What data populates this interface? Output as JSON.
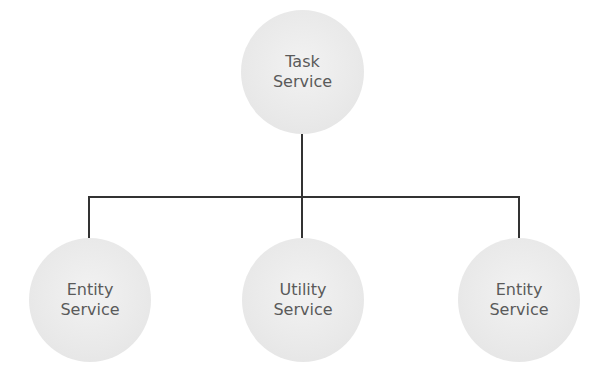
{
  "diagram": {
    "type": "hierarchy",
    "root": {
      "line1": "Task",
      "line2": "Service"
    },
    "children": [
      {
        "line1": "Entity",
        "line2": "Service"
      },
      {
        "line1": "Utility",
        "line2": "Service"
      },
      {
        "line1": "Entity",
        "line2": "Service"
      }
    ],
    "colors": {
      "node_fill": "#e9e9e9",
      "text": "#5a5a5a",
      "connector": "#333333"
    }
  }
}
